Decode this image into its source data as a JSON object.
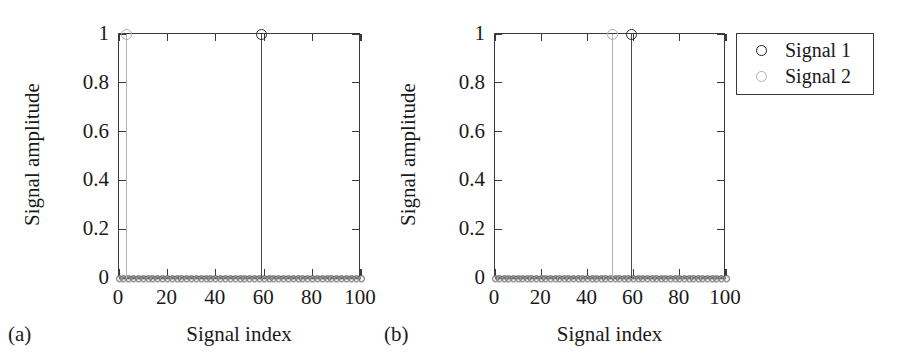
{
  "figure": {
    "panels": [
      {
        "caption": "(a)",
        "xlabel": "Signal index",
        "ylabel": "Signal amplitude"
      },
      {
        "caption": "(b)",
        "xlabel": "Signal index",
        "ylabel": "Signal amplitude"
      }
    ]
  },
  "legend": {
    "entries": [
      {
        "label": "Signal 1",
        "marker": "open-circle-dark",
        "color": "#1f1f1f"
      },
      {
        "label": "Signal 2",
        "marker": "open-circle-light",
        "color": "#b0b0b0"
      }
    ]
  },
  "axis_labels": {
    "x_ticks": [
      "0",
      "20",
      "40",
      "60",
      "80",
      "100"
    ],
    "y_ticks": [
      "0",
      "0.2",
      "0.4",
      "0.6",
      "0.8",
      "1"
    ]
  },
  "chart_data": [
    {
      "type": "line",
      "panel": "(a)",
      "title": "",
      "xlabel": "Signal index",
      "ylabel": "Signal amplitude",
      "xlim": [
        0,
        100
      ],
      "ylim": [
        0,
        1
      ],
      "xticks": [
        0,
        20,
        40,
        60,
        80,
        100
      ],
      "yticks": [
        0,
        0.2,
        0.4,
        0.6,
        0.8,
        1
      ],
      "grid": false,
      "legend_position": "outside-right",
      "series": [
        {
          "name": "Signal 1",
          "color": "#2b2b2b",
          "marker": "o",
          "peak_index": 59,
          "peak_value": 1,
          "baseline_value": 0,
          "description": "Flat at 0 for all indices except a single unit spike at index 59."
        },
        {
          "name": "Signal 2",
          "color": "#b0b0b0",
          "marker": "o",
          "peak_index": 3,
          "peak_value": 1,
          "baseline_value": 0,
          "description": "Flat at 0 for all indices except a single unit spike at index 3."
        }
      ]
    },
    {
      "type": "line",
      "panel": "(b)",
      "title": "",
      "xlabel": "Signal index",
      "ylabel": "Signal amplitude",
      "xlim": [
        0,
        100
      ],
      "ylim": [
        0,
        1
      ],
      "xticks": [
        0,
        20,
        40,
        60,
        80,
        100
      ],
      "yticks": [
        0,
        0.2,
        0.4,
        0.6,
        0.8,
        1
      ],
      "grid": false,
      "legend_position": "outside-right",
      "series": [
        {
          "name": "Signal 1",
          "color": "#2b2b2b",
          "marker": "o",
          "peak_index": 59,
          "peak_value": 1,
          "baseline_value": 0,
          "description": "Flat at 0 for all indices except a single unit spike at index 59."
        },
        {
          "name": "Signal 2",
          "color": "#b0b0b0",
          "marker": "o",
          "peak_index": 51,
          "peak_value": 1,
          "baseline_value": 0,
          "description": "Flat at 0 for all indices except a single unit spike at index 51."
        }
      ]
    }
  ]
}
